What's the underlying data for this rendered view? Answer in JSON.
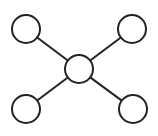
{
  "diagram": {
    "type": "hub-and-spoke network",
    "stroke_color": "#222222",
    "fill_color": "#ffffff",
    "stroke_width": 2,
    "hub": {
      "id": "center",
      "cx": 79,
      "cy": 69,
      "r": 14
    },
    "nodes": [
      {
        "id": "top-left",
        "cx": 26,
        "cy": 29,
        "r": 14
      },
      {
        "id": "top-right",
        "cx": 132,
        "cy": 29,
        "r": 14
      },
      {
        "id": "bottom-left",
        "cx": 26,
        "cy": 109,
        "r": 14
      },
      {
        "id": "bottom-right",
        "cx": 133,
        "cy": 109,
        "r": 14
      }
    ],
    "edges": [
      {
        "from": "center",
        "to": "top-left"
      },
      {
        "from": "center",
        "to": "top-right"
      },
      {
        "from": "center",
        "to": "bottom-left"
      },
      {
        "from": "center",
        "to": "bottom-right"
      }
    ]
  }
}
